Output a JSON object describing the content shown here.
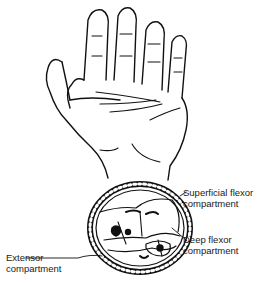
{
  "figure": {
    "labels": [
      {
        "id": "superficial_flexor",
        "line1": "Superficial flexor",
        "line2": "compartment"
      },
      {
        "id": "deep_flexor",
        "line1": "Deep flexor",
        "line2": "compartment"
      },
      {
        "id": "extensor",
        "line1": "Extensor",
        "line2": "compartment"
      }
    ]
  }
}
